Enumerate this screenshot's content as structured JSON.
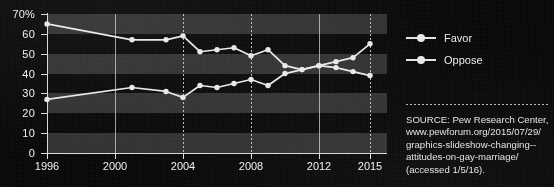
{
  "chart_data": {
    "type": "line",
    "title": "",
    "xlabel": "",
    "ylabel": "",
    "xlim": [
      1996,
      2016
    ],
    "ylim": [
      0,
      70
    ],
    "grid": "vertical dotted gridlines at 2000, 2004, 2008, 2012, 2015; horizontal alternating gray bands",
    "legend_position": "right",
    "y_ticks": [
      "70%",
      "60",
      "50",
      "40",
      "30",
      "20",
      "10",
      "0"
    ],
    "y_tick_values": [
      70,
      60,
      50,
      40,
      30,
      20,
      10,
      0
    ],
    "x_ticks": [
      "1996",
      "2000",
      "2004",
      "2008",
      "2012",
      "2015"
    ],
    "x_tick_values": [
      1996,
      2000,
      2004,
      2008,
      2012,
      2015
    ],
    "series": [
      {
        "name": "Favor",
        "color": "#e8e8e8",
        "x": [
          1996,
          2001,
          2003,
          2004,
          2005,
          2006,
          2007,
          2008,
          2009,
          2010,
          2011,
          2012,
          2013,
          2014,
          2015
        ],
        "values": [
          27,
          33,
          31,
          28,
          34,
          33,
          35,
          37,
          34,
          40,
          42,
          44,
          46,
          48,
          55
        ]
      },
      {
        "name": "Oppose",
        "color": "#e8e8e8",
        "x": [
          1996,
          2001,
          2003,
          2004,
          2005,
          2006,
          2007,
          2008,
          2009,
          2010,
          2011,
          2012,
          2013,
          2014,
          2015
        ],
        "values": [
          65,
          57,
          57,
          59,
          51,
          52,
          53,
          49,
          52,
          44,
          42,
          44,
          43,
          41,
          39
        ]
      }
    ]
  },
  "legend": {
    "items": [
      {
        "label": "Favor"
      },
      {
        "label": "Oppose"
      }
    ]
  },
  "source": {
    "lines": [
      "SOURCE: Pew Research Center,",
      "www.pewforum.org/2015/07/29/",
      "graphics-slideshow-changing--",
      "attitudes-on-gay-marriage/",
      "(accessed 1/5/16)."
    ]
  },
  "colors": {
    "background": "#080808",
    "band": "#4b4b4b",
    "axis": "#d8d8d8",
    "line": "#e8e8e8",
    "text": "#f0f0f0"
  }
}
